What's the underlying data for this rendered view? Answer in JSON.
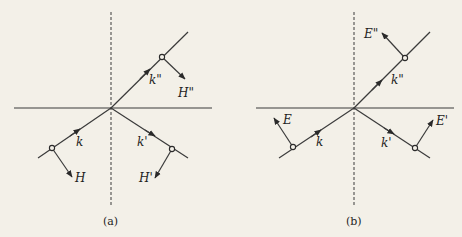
{
  "figure": {
    "panels": [
      {
        "id": "a",
        "caption": "(a)",
        "field": "H",
        "labels": {
          "k": "k",
          "k_reflected": "k'",
          "k_transmitted": "k\"",
          "f_incident": "H",
          "f_reflected": "H'",
          "f_transmitted": "H\""
        }
      },
      {
        "id": "b",
        "caption": "(b)",
        "field": "E",
        "labels": {
          "k": "k",
          "k_reflected": "k'",
          "k_transmitted": "k\"",
          "f_incident": "E",
          "f_reflected": "E'",
          "f_transmitted": "E\""
        }
      }
    ]
  },
  "colors": {
    "ink": "#2a2a2a",
    "paper": "#f3f0e8"
  }
}
